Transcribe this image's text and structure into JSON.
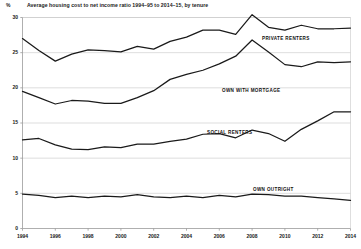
{
  "chart_data": {
    "type": "line",
    "title": "Average housing cost to net income ratio 1994–95 to 2014–15, by tenure",
    "xlabel": "",
    "ylabel": "%",
    "yunit": "%",
    "ylim": [
      0,
      30
    ],
    "ytick_labels": [
      "0",
      "5",
      "10",
      "15",
      "20",
      "25",
      "30"
    ],
    "ytick_values": [
      0,
      5,
      10,
      15,
      20,
      25,
      30
    ],
    "xlim": [
      1994,
      2014
    ],
    "xtick_labels": [
      "1994",
      "1996",
      "1998",
      "2000",
      "2002",
      "2004",
      "2006",
      "2008",
      "2010",
      "2012",
      "2014"
    ],
    "xtick_values": [
      1994,
      1996,
      1998,
      2000,
      2002,
      2004,
      2006,
      2008,
      2010,
      2012,
      2014
    ],
    "grid": true,
    "legend_position": "inline-labels",
    "line_color": "#1a1a1a",
    "grid_color": "#c8c8c8",
    "axis_color": "#9a9a9a",
    "x": [
      1994,
      1995,
      1996,
      1997,
      1998,
      1999,
      2000,
      2001,
      2002,
      2003,
      2004,
      2005,
      2006,
      2007,
      2008,
      2009,
      2010,
      2011,
      2012,
      2013,
      2014
    ],
    "series": [
      {
        "name": "PRIVATE RENTERS",
        "label_x": 262,
        "label_y": 36,
        "values": [
          27.0,
          25.3,
          23.8,
          24.8,
          25.4,
          25.3,
          25.1,
          25.9,
          25.5,
          26.6,
          27.2,
          28.2,
          28.2,
          27.6,
          30.4,
          28.6,
          28.2,
          28.9,
          28.4,
          28.4,
          28.5
        ]
      },
      {
        "name": "OWN WITH MORTGAGE",
        "label_x": 222,
        "label_y": 88,
        "values": [
          19.5,
          18.6,
          17.7,
          18.2,
          18.1,
          17.8,
          17.8,
          18.6,
          19.6,
          21.2,
          21.9,
          22.5,
          23.4,
          24.5,
          26.8,
          25.1,
          23.3,
          23.0,
          23.7,
          23.6,
          23.7
        ]
      },
      {
        "name": "SOCIAL RENTERS",
        "label_x": 207,
        "label_y": 130,
        "values": [
          12.6,
          12.8,
          11.9,
          11.3,
          11.2,
          11.6,
          11.5,
          12.0,
          12.0,
          12.4,
          12.7,
          13.4,
          13.5,
          12.9,
          14.0,
          13.5,
          12.4,
          14.1,
          15.3,
          16.6,
          16.6
        ]
      },
      {
        "name": "OWN OUTRIGHT",
        "label_x": 253,
        "label_y": 187,
        "values": [
          4.9,
          4.7,
          4.4,
          4.6,
          4.4,
          4.6,
          4.5,
          4.8,
          4.5,
          4.4,
          4.6,
          4.4,
          4.7,
          4.5,
          4.9,
          4.8,
          4.6,
          4.6,
          4.4,
          4.2,
          4.0
        ]
      }
    ]
  }
}
